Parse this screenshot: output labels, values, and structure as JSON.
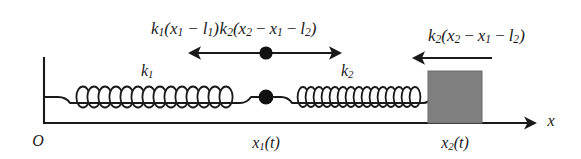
{
  "figure": {
    "axis": {
      "x_label": "x",
      "origin_label": "O"
    },
    "colors": {
      "line": "#1a1a1a",
      "block_fill": "#808080",
      "block_stroke": "#4d4d4d",
      "mass_fill": "#111111",
      "background": "#ffffff"
    },
    "springs": [
      {
        "name": "spring-1",
        "stiffness_label": "k",
        "stiffness_sub": "1",
        "coils": 13
      },
      {
        "name": "spring-2",
        "stiffness_label": "k",
        "stiffness_sub": "2",
        "coils": 16
      }
    ],
    "position_labels": [
      {
        "name": "position-x1",
        "base": "x",
        "sub": "1",
        "arg": "(t)"
      },
      {
        "name": "position-x2",
        "base": "x",
        "sub": "2",
        "arg": "(t)"
      }
    ],
    "force_labels": [
      {
        "name": "force-spring1-on-mass1",
        "text": "k₁(x₁ − l₁)",
        "parts": [
          "k",
          "1",
          "(",
          "x",
          "1",
          "−",
          "l",
          "1",
          ")"
        ]
      },
      {
        "name": "force-spring2-on-mass1",
        "text": "k₂(x₂ − x₁ − l₂)",
        "parts": [
          "k",
          "2",
          "(",
          "x",
          "2",
          "−",
          "x",
          "1",
          "−",
          "l",
          "2",
          ")"
        ]
      },
      {
        "name": "force-spring2-on-mass2",
        "text": "k₂(x₂ − x₁ − l₂)",
        "parts": [
          "k",
          "2",
          "(",
          "x",
          "2",
          "−",
          "x",
          "1",
          "−",
          "l",
          "2",
          ")"
        ]
      }
    ],
    "arrows": [
      {
        "name": "arrow-left-force-mass1",
        "direction": "left"
      },
      {
        "name": "arrow-right-force-mass1",
        "direction": "right"
      },
      {
        "name": "arrow-left-force-mass2",
        "direction": "left"
      },
      {
        "name": "arrow-x-axis",
        "direction": "right"
      }
    ],
    "glyphs": {
      "minus": "−",
      "lparen": "(",
      "rparen": ")",
      "t_arg_open": "(",
      "t_arg_close": ")",
      "t": "t",
      "l": "l",
      "k": "k",
      "x": "x"
    }
  }
}
